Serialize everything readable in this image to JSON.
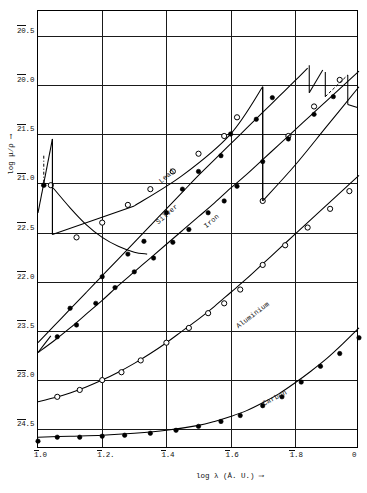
{
  "chart_data": {
    "type": "line",
    "title": "",
    "xlabel": "log λ (Å. U.) ⟶",
    "ylabel": "log μ/ρ ⟶",
    "xlim": [
      1.0,
      2.0
    ],
    "ylim": [
      -4.7,
      -0.25
    ],
    "grid": true,
    "legend_position": "inline-curve-labels",
    "note": "X-ray mass absorption coefficient log(mu/rho) versus log wavelength. Y tick labels use bar (overline) notation for negative characteristics, e.g. 2bar0.5 = -1.5 region labels as printed.",
    "xticks": [
      {
        "value": 1.0,
        "bar": "1",
        "rest": ".0"
      },
      {
        "value": 1.2,
        "bar": "1",
        "rest": ".2."
      },
      {
        "value": 1.4,
        "bar": "1",
        "rest": ".4"
      },
      {
        "value": 1.6,
        "bar": "1",
        "rest": ".6"
      },
      {
        "value": 1.8,
        "bar": "1",
        "rest": ".8"
      },
      {
        "value": 2.0,
        "bar": "",
        "rest": "0"
      }
    ],
    "yticks": [
      {
        "value": -0.5,
        "bar": "20",
        "rest": ".5"
      },
      {
        "value": -1.0,
        "bar": "20",
        "rest": ".0"
      },
      {
        "value": -1.5,
        "bar": "21",
        "rest": ".5"
      },
      {
        "value": -2.0,
        "bar": "21",
        "rest": ".0"
      },
      {
        "value": -2.5,
        "bar": "22",
        "rest": ".5"
      },
      {
        "value": -3.0,
        "bar": "22",
        "rest": ".0"
      },
      {
        "value": -3.5,
        "bar": "23",
        "rest": ".5"
      },
      {
        "value": -4.0,
        "bar": "23",
        "rest": ".0"
      },
      {
        "value": -4.5,
        "bar": "24",
        "rest": ".5"
      }
    ],
    "series": [
      {
        "name": "Lead",
        "label": "Lead",
        "marker": "filled-circle",
        "curve": [
          [
            1.0,
            -3.62
          ],
          [
            1.05,
            -3.45
          ],
          [
            1.1,
            -3.28
          ],
          [
            1.15,
            -3.11
          ],
          [
            1.2,
            -2.94
          ],
          [
            1.25,
            -2.77
          ],
          [
            1.3,
            -2.6
          ],
          [
            1.35,
            -2.43
          ],
          [
            1.4,
            -2.26
          ],
          [
            1.45,
            -2.09
          ],
          [
            1.5,
            -1.92
          ],
          [
            1.55,
            -1.76
          ],
          [
            1.6,
            -1.6
          ],
          [
            1.65,
            -1.44
          ],
          [
            1.7,
            -1.28
          ],
          [
            1.75,
            -1.12
          ],
          [
            1.8,
            -0.96
          ],
          [
            1.84,
            -0.83
          ]
        ],
        "points": [
          [
            1.1,
            -3.27
          ],
          [
            1.2,
            -2.95
          ],
          [
            1.28,
            -2.72
          ],
          [
            1.33,
            -2.59
          ],
          [
            1.4,
            -2.3
          ],
          [
            1.45,
            -2.06
          ],
          [
            1.5,
            -1.88
          ],
          [
            1.57,
            -1.72
          ],
          [
            1.6,
            -1.5
          ],
          [
            1.68,
            -1.35
          ],
          [
            1.73,
            -1.13
          ]
        ],
        "absorption_edges": [
          {
            "type": "L1",
            "x": 1.845,
            "y_top": -0.8,
            "y_bottom": -1.08
          },
          {
            "type": "L2",
            "x": 1.895,
            "y_top": -0.87,
            "y_bottom": -1.12
          },
          {
            "type": "L3",
            "x": 1.965,
            "y_top": -0.9,
            "y_bottom": -1.2
          }
        ]
      },
      {
        "name": "Silver",
        "label": "Silver",
        "marker": "open-circle",
        "curve": [
          [
            1.0,
            -3.72
          ],
          [
            1.04,
            -3.55
          ],
          [
            1.04,
            -2.02
          ],
          [
            1.1,
            -2.25
          ],
          [
            1.15,
            -2.42
          ],
          [
            1.2,
            -2.55
          ],
          [
            1.25,
            -2.64
          ],
          [
            1.3,
            -2.7
          ],
          [
            1.34,
            -2.72
          ]
        ],
        "points": [
          [
            1.04,
            -2.02
          ],
          [
            1.12,
            -2.55
          ],
          [
            1.2,
            -2.4
          ],
          [
            1.28,
            -2.22
          ],
          [
            1.35,
            -2.06
          ],
          [
            1.42,
            -1.88
          ],
          [
            1.5,
            -1.7
          ],
          [
            1.58,
            -1.52
          ],
          [
            1.62,
            -1.33
          ],
          [
            1.7,
            -2.18
          ],
          [
            1.78,
            -1.52
          ],
          [
            1.86,
            -1.22
          ],
          [
            1.94,
            -0.95
          ]
        ],
        "absorption_edges": [
          {
            "type": "K",
            "x": 1.045,
            "y_top": -1.55,
            "y_bottom": -2.52
          },
          {
            "type": "K",
            "x": 1.7,
            "y_top": -1.02,
            "y_bottom": -2.18
          }
        ]
      },
      {
        "name": "Iron",
        "label": "Iron",
        "marker": "filled-circle",
        "curve": [
          [
            1.0,
            -3.72
          ],
          [
            1.05,
            -3.6
          ],
          [
            1.1,
            -3.47
          ],
          [
            1.15,
            -3.33
          ],
          [
            1.2,
            -3.19
          ],
          [
            1.25,
            -3.04
          ],
          [
            1.3,
            -2.9
          ],
          [
            1.35,
            -2.76
          ],
          [
            1.4,
            -2.62
          ],
          [
            1.45,
            -2.48
          ],
          [
            1.5,
            -2.34
          ],
          [
            1.55,
            -2.2
          ],
          [
            1.6,
            -2.05
          ],
          [
            1.65,
            -1.91
          ],
          [
            1.7,
            -1.76
          ],
          [
            1.75,
            -1.61
          ],
          [
            1.8,
            -1.46
          ],
          [
            1.85,
            -1.31
          ],
          [
            1.9,
            -1.16
          ],
          [
            1.95,
            -1.01
          ],
          [
            2.0,
            -0.86
          ]
        ],
        "points": [
          [
            1.06,
            -3.56
          ],
          [
            1.12,
            -3.44
          ],
          [
            1.18,
            -3.22
          ],
          [
            1.24,
            -3.06
          ],
          [
            1.3,
            -2.9
          ],
          [
            1.36,
            -2.76
          ],
          [
            1.42,
            -2.6
          ],
          [
            1.47,
            -2.47
          ],
          [
            1.53,
            -2.3
          ],
          [
            1.58,
            -2.18
          ],
          [
            1.62,
            -2.03
          ],
          [
            1.7,
            -1.78
          ],
          [
            1.78,
            -1.55
          ],
          [
            1.86,
            -1.3
          ],
          [
            1.92,
            -1.12
          ]
        ],
        "absorption_edges": []
      },
      {
        "name": "Aluminium",
        "label": "Aluminium",
        "marker": "open-circle",
        "curve": [
          [
            1.0,
            -4.22
          ],
          [
            1.05,
            -4.18
          ],
          [
            1.1,
            -4.13
          ],
          [
            1.15,
            -4.07
          ],
          [
            1.2,
            -4.0
          ],
          [
            1.25,
            -3.92
          ],
          [
            1.3,
            -3.83
          ],
          [
            1.35,
            -3.73
          ],
          [
            1.4,
            -3.62
          ],
          [
            1.45,
            -3.5
          ],
          [
            1.5,
            -3.38
          ],
          [
            1.55,
            -3.25
          ],
          [
            1.6,
            -3.11
          ],
          [
            1.65,
            -2.97
          ],
          [
            1.7,
            -2.82
          ],
          [
            1.75,
            -2.67
          ],
          [
            1.8,
            -2.52
          ],
          [
            1.85,
            -2.37
          ],
          [
            1.9,
            -2.22
          ],
          [
            1.95,
            -2.07
          ],
          [
            2.0,
            -1.92
          ]
        ],
        "points": [
          [
            1.06,
            -4.17
          ],
          [
            1.13,
            -4.1
          ],
          [
            1.2,
            -4.0
          ],
          [
            1.26,
            -3.92
          ],
          [
            1.32,
            -3.8
          ],
          [
            1.4,
            -3.62
          ],
          [
            1.47,
            -3.47
          ],
          [
            1.53,
            -3.32
          ],
          [
            1.58,
            -3.22
          ],
          [
            1.63,
            -3.08
          ],
          [
            1.7,
            -2.83
          ],
          [
            1.77,
            -2.63
          ],
          [
            1.84,
            -2.45
          ],
          [
            1.91,
            -2.26
          ],
          [
            1.97,
            -2.08
          ]
        ],
        "absorption_edges": []
      },
      {
        "name": "Carbon",
        "label": "Carbon",
        "marker": "filled-circle",
        "curve": [
          [
            1.0,
            -4.58
          ],
          [
            1.1,
            -4.57
          ],
          [
            1.2,
            -4.56
          ],
          [
            1.3,
            -4.54
          ],
          [
            1.4,
            -4.51
          ],
          [
            1.5,
            -4.46
          ],
          [
            1.55,
            -4.42
          ],
          [
            1.6,
            -4.37
          ],
          [
            1.65,
            -4.31
          ],
          [
            1.7,
            -4.23
          ],
          [
            1.75,
            -4.14
          ],
          [
            1.8,
            -4.03
          ],
          [
            1.85,
            -3.91
          ],
          [
            1.9,
            -3.78
          ],
          [
            1.95,
            -3.63
          ],
          [
            2.0,
            -3.47
          ]
        ],
        "points": [
          [
            1.0,
            -4.62
          ],
          [
            1.06,
            -4.58
          ],
          [
            1.13,
            -4.58
          ],
          [
            1.2,
            -4.57
          ],
          [
            1.27,
            -4.56
          ],
          [
            1.35,
            -4.54
          ],
          [
            1.43,
            -4.51
          ],
          [
            1.5,
            -4.47
          ],
          [
            1.57,
            -4.42
          ],
          [
            1.63,
            -4.36
          ],
          [
            1.7,
            -4.26
          ],
          [
            1.76,
            -4.17
          ],
          [
            1.82,
            -4.02
          ],
          [
            1.88,
            -3.86
          ],
          [
            1.94,
            -3.73
          ],
          [
            2.0,
            -3.57
          ]
        ],
        "absorption_edges": []
      }
    ]
  }
}
